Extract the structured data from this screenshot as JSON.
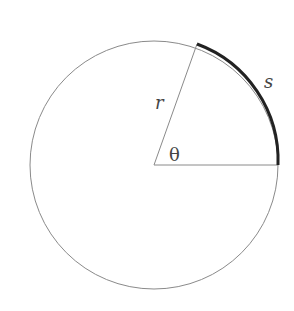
{
  "diagram": {
    "labels": {
      "radius": "r",
      "arc": "s",
      "angle": "θ"
    },
    "geometry": {
      "center": [
        154,
        165
      ],
      "radius": 124,
      "angle_degrees": 70
    },
    "colors": {
      "circle": "#8a8a8a",
      "radius_lines": "#8a8a8a",
      "arc": "#222222",
      "text": "#444444"
    }
  }
}
